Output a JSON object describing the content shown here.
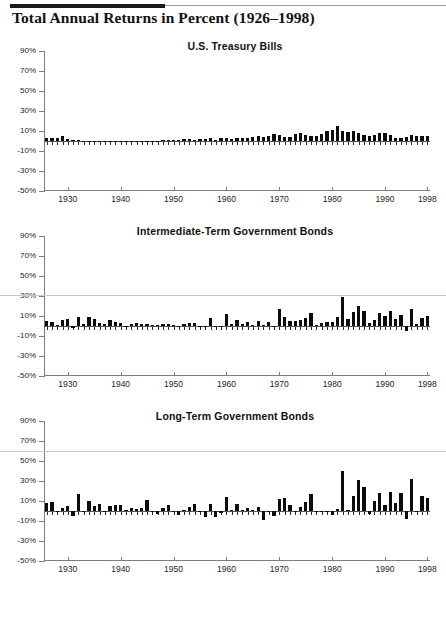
{
  "page": {
    "heading": "Total Annual Returns in Percent (1926–1998)"
  },
  "axis": {
    "y_ticks": [
      "90%",
      "70%",
      "50%",
      "30%",
      "10%",
      "-10%",
      "-30%",
      "-50%"
    ],
    "x_ticks": [
      "1930",
      "1940",
      "1950",
      "1960",
      "1970",
      "1980",
      "1990",
      "1998"
    ]
  },
  "chart_data": [
    {
      "type": "bar",
      "title": "U.S. Treasury Bills",
      "xlabel": "",
      "ylabel": "",
      "ylim": [
        -50,
        90
      ],
      "xlim": [
        1926,
        1998
      ],
      "grid": false,
      "legend": "none",
      "ytick_values": [
        90,
        70,
        50,
        30,
        10,
        -10,
        -30,
        -50
      ],
      "xtick_values": [
        1930,
        1940,
        1950,
        1960,
        1970,
        1980,
        1990,
        1998
      ],
      "x": [
        1926,
        1927,
        1928,
        1929,
        1930,
        1931,
        1932,
        1933,
        1934,
        1935,
        1936,
        1937,
        1938,
        1939,
        1940,
        1941,
        1942,
        1943,
        1944,
        1945,
        1946,
        1947,
        1948,
        1949,
        1950,
        1951,
        1952,
        1953,
        1954,
        1955,
        1956,
        1957,
        1958,
        1959,
        1960,
        1961,
        1962,
        1963,
        1964,
        1965,
        1966,
        1967,
        1968,
        1969,
        1970,
        1971,
        1972,
        1973,
        1974,
        1975,
        1976,
        1977,
        1978,
        1979,
        1980,
        1981,
        1982,
        1983,
        1984,
        1985,
        1986,
        1987,
        1988,
        1989,
        1990,
        1991,
        1992,
        1993,
        1994,
        1995,
        1996,
        1997,
        1998
      ],
      "values": [
        3.3,
        3.1,
        3.2,
        4.7,
        2.4,
        1.1,
        1.0,
        0.3,
        0.2,
        0.2,
        0.2,
        0.3,
        0.0,
        0.0,
        0.0,
        0.1,
        0.3,
        0.4,
        0.3,
        0.3,
        0.4,
        0.5,
        0.8,
        1.1,
        1.2,
        1.5,
        1.7,
        1.8,
        0.9,
        1.6,
        2.5,
        3.1,
        1.5,
        3.0,
        2.7,
        2.1,
        2.7,
        3.1,
        3.5,
        3.9,
        4.8,
        4.2,
        5.2,
        6.6,
        6.5,
        4.4,
        3.8,
        6.9,
        8.0,
        5.8,
        5.1,
        5.1,
        7.2,
        10.4,
        11.2,
        14.7,
        10.5,
        8.8,
        9.9,
        7.7,
        6.2,
        5.5,
        6.4,
        8.4,
        7.8,
        5.6,
        3.5,
        2.9,
        3.9,
        5.6,
        5.2,
        5.3,
        4.9
      ]
    },
    {
      "type": "bar",
      "title": "Intermediate-Term Government Bonds",
      "xlabel": "",
      "ylabel": "",
      "ylim": [
        -50,
        90
      ],
      "xlim": [
        1926,
        1998
      ],
      "grid": false,
      "legend": "none",
      "ytick_values": [
        90,
        70,
        50,
        30,
        10,
        -10,
        -30,
        -50
      ],
      "xtick_values": [
        1930,
        1940,
        1950,
        1960,
        1970,
        1980,
        1990,
        1998
      ],
      "x": [
        1926,
        1927,
        1928,
        1929,
        1930,
        1931,
        1932,
        1933,
        1934,
        1935,
        1936,
        1937,
        1938,
        1939,
        1940,
        1941,
        1942,
        1943,
        1944,
        1945,
        1946,
        1947,
        1948,
        1949,
        1950,
        1951,
        1952,
        1953,
        1954,
        1955,
        1956,
        1957,
        1958,
        1959,
        1960,
        1961,
        1962,
        1963,
        1964,
        1965,
        1966,
        1967,
        1968,
        1969,
        1970,
        1971,
        1972,
        1973,
        1974,
        1975,
        1976,
        1977,
        1978,
        1979,
        1980,
        1981,
        1982,
        1983,
        1984,
        1985,
        1986,
        1987,
        1988,
        1989,
        1990,
        1991,
        1992,
        1993,
        1994,
        1995,
        1996,
        1997,
        1998
      ],
      "values": [
        5.4,
        4.5,
        0.9,
        6.0,
        6.7,
        -2.3,
        8.8,
        1.8,
        9.0,
        7.0,
        3.1,
        1.6,
        6.2,
        4.5,
        3.0,
        0.5,
        1.9,
        2.8,
        1.8,
        2.2,
        1.0,
        0.9,
        1.9,
        2.3,
        0.7,
        0.4,
        1.6,
        3.2,
        2.7,
        -0.7,
        -0.4,
        7.8,
        -1.3,
        -0.4,
        11.8,
        2.0,
        5.7,
        1.7,
        4.0,
        1.0,
        4.7,
        1.0,
        4.5,
        -0.7,
        16.9,
        8.7,
        5.2,
        4.6,
        5.7,
        7.8,
        12.9,
        1.4,
        3.5,
        4.1,
        3.9,
        9.5,
        29.1,
        7.4,
        14.0,
        20.3,
        15.1,
        2.9,
        6.1,
        13.3,
        9.7,
        15.5,
        7.2,
        11.2,
        -5.1,
        16.8,
        2.1,
        8.4,
        10.2
      ]
    },
    {
      "type": "bar",
      "title": "Long-Term Government Bonds",
      "xlabel": "",
      "ylabel": "",
      "ylim": [
        -50,
        90
      ],
      "xlim": [
        1926,
        1998
      ],
      "grid": false,
      "legend": "none",
      "ytick_values": [
        90,
        70,
        50,
        30,
        10,
        -10,
        -30,
        -50
      ],
      "xtick_values": [
        1930,
        1940,
        1950,
        1960,
        1970,
        1980,
        1990,
        1998
      ],
      "x": [
        1926,
        1927,
        1928,
        1929,
        1930,
        1931,
        1932,
        1933,
        1934,
        1935,
        1936,
        1937,
        1938,
        1939,
        1940,
        1941,
        1942,
        1943,
        1944,
        1945,
        1946,
        1947,
        1948,
        1949,
        1950,
        1951,
        1952,
        1953,
        1954,
        1955,
        1956,
        1957,
        1958,
        1959,
        1960,
        1961,
        1962,
        1963,
        1964,
        1965,
        1966,
        1967,
        1968,
        1969,
        1970,
        1971,
        1972,
        1973,
        1974,
        1975,
        1976,
        1977,
        1978,
        1979,
        1980,
        1981,
        1982,
        1983,
        1984,
        1985,
        1986,
        1987,
        1988,
        1989,
        1990,
        1991,
        1992,
        1993,
        1994,
        1995,
        1996,
        1997,
        1998
      ],
      "values": [
        7.8,
        8.9,
        0.1,
        3.4,
        4.7,
        -5.3,
        16.8,
        -0.1,
        10.0,
        5.0,
        7.5,
        0.2,
        5.5,
        5.9,
        6.1,
        0.9,
        3.2,
        2.1,
        2.8,
        10.7,
        -0.1,
        -2.6,
        3.4,
        6.5,
        0.1,
        -3.9,
        1.2,
        3.6,
        7.2,
        -1.3,
        -5.6,
        7.5,
        -6.1,
        -2.3,
        13.8,
        1.0,
        6.9,
        1.2,
        3.5,
        0.7,
        3.6,
        -9.2,
        -0.3,
        -5.1,
        12.1,
        13.2,
        5.7,
        -1.1,
        4.4,
        9.2,
        16.8,
        -0.7,
        -1.2,
        -1.2,
        -4.0,
        1.9,
        40.4,
        0.7,
        15.5,
        31.0,
        24.5,
        -2.7,
        9.7,
        18.1,
        6.2,
        19.3,
        8.1,
        18.2,
        -7.8,
        31.7,
        -0.9,
        15.1,
        13.5
      ]
    }
  ]
}
